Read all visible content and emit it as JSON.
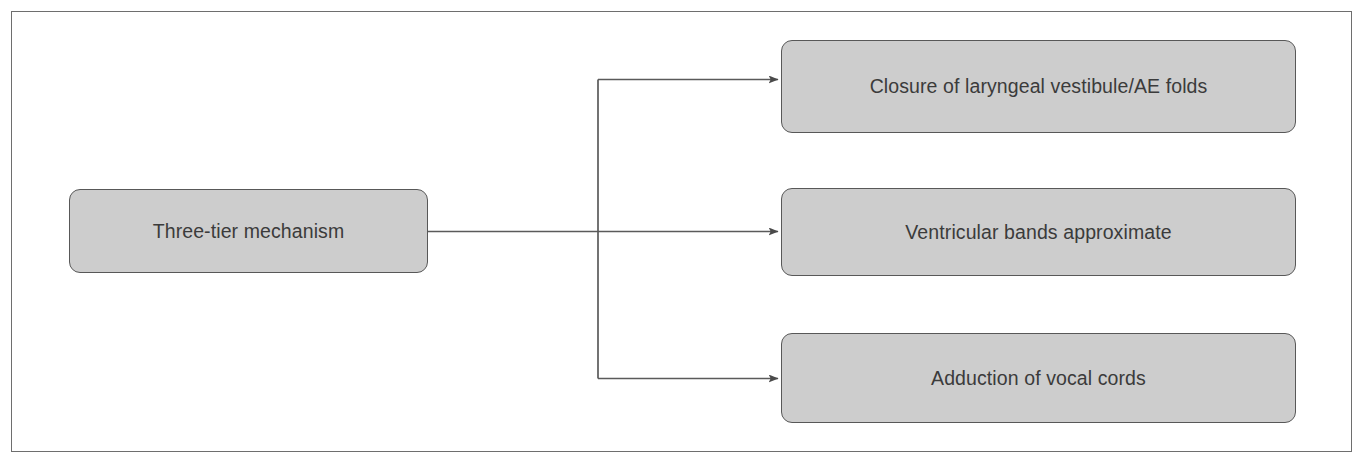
{
  "figure": {
    "kind": "flow-diagram",
    "orientation": "left-to-right",
    "title": "Three-tier mechanism",
    "frame_color": "#6e6e6e",
    "node_fill": "#cdcdcd",
    "node_border": "#585858",
    "text_color": "#3b3b3b",
    "connector_color": "#5a5a5a",
    "background": "#ffffff"
  },
  "source": {
    "label": "Three-tier mechanism"
  },
  "targets": [
    {
      "label": "Closure of laryngeal vestibule/AE folds"
    },
    {
      "label": "Ventricular bands approximate"
    },
    {
      "label": "Adduction of vocal cords"
    }
  ],
  "connectors": {
    "count": 3,
    "style": "orthogonal-branch-with-arrowheads",
    "arrowhead": "solid-triangle"
  }
}
